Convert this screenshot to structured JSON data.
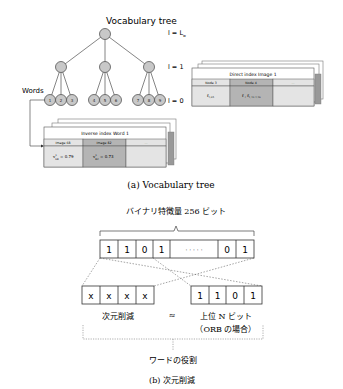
{
  "panel_a": {
    "title": "Vocabulary tree",
    "caption": "(a) Vocabulary tree",
    "words_label": "Words",
    "levels": {
      "top": "l = L",
      "top_sub": "w",
      "mid": "l = 1",
      "bottom": "l = 0"
    },
    "leaf_nodes": [
      "1",
      "2",
      "3",
      "4",
      "5",
      "6",
      "7",
      "8",
      "9"
    ],
    "direct_index": {
      "title": "Direct index Image 1",
      "headers": [
        "Node 3",
        "Node 4",
        "..."
      ],
      "cells": [
        "f",
        "f , f",
        ""
      ],
      "cell_subs": [
        "1,65",
        "1,10  1,16"
      ]
    },
    "inverse_index": {
      "title": "Inverse index Word 1",
      "headers": [
        "Image 68",
        "Image 82",
        "..."
      ],
      "cells": [
        "= 0.79",
        "= 0.73",
        ""
      ],
      "cell_vars": [
        "v",
        "v"
      ],
      "cell_subs": [
        "68",
        "82"
      ],
      "cell_sups": [
        "1",
        "1"
      ]
    },
    "colors": {
      "node_fill": "#c8c8c8",
      "node_stroke": "#555555",
      "shaded": "#b4b4b4",
      "light": "#e4e4e4"
    }
  },
  "panel_b": {
    "top_label": "バイナリ特徴量 256 ビット",
    "bits_top": [
      "1",
      "1",
      "0",
      "1",
      "· · · · ·",
      "0",
      "1"
    ],
    "bits_left": [
      "x",
      "x",
      "x",
      "x"
    ],
    "bits_right": [
      "1",
      "1",
      "0",
      "1"
    ],
    "left_label": "次元削減",
    "approx": "≈",
    "right_label_1": "上位 N ビット",
    "right_label_2": "（ORB の場合）",
    "bottom_label": "ワードの役割",
    "caption": "(b) 次元削減"
  }
}
